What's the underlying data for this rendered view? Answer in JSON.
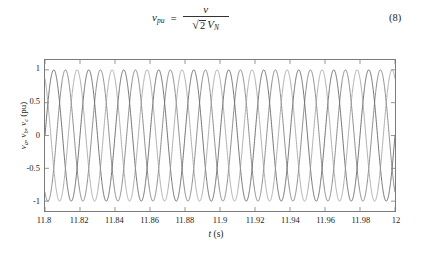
{
  "equation": {
    "lhs_var": "v",
    "lhs_sub": "pu",
    "equals": "=",
    "numerator": "v",
    "radical_glyph": "√",
    "radicand": "2",
    "denominator_var": "V",
    "denominator_sub": "N",
    "number": "(8)"
  },
  "chart_data": {
    "type": "line",
    "title": "",
    "xlabel_main": "t",
    "xlabel_unit": "(s)",
    "ylabel_parts": [
      "v",
      "a",
      ", ",
      "v",
      "b",
      ", ",
      "v",
      "c",
      " (pu)"
    ],
    "ylabel_plain": "v_a, v_b, v_c (pu)",
    "xlim": [
      11.8,
      12.0
    ],
    "ylim": [
      -1.15,
      1.15
    ],
    "xticks": [
      11.8,
      11.82,
      11.84,
      11.86,
      11.88,
      11.9,
      11.92,
      11.94,
      11.96,
      11.98,
      12
    ],
    "xticklabels": [
      "11.8",
      "11.82",
      "11.84",
      "11.86",
      "11.88",
      "11.9",
      "11.92",
      "11.94",
      "11.96",
      "11.98",
      "12"
    ],
    "yticks": [
      1,
      0.5,
      0,
      -0.5,
      -1
    ],
    "yticklabels": [
      "1",
      "0.5",
      "0",
      "-0.5",
      "-1"
    ],
    "grid": false,
    "legend": "none",
    "frequency_hz": 50,
    "amplitude_pu": 1.0,
    "series": [
      {
        "name": "v_a",
        "phase_deg": 0,
        "color": "#4d4d4d",
        "linewidth": 0.8
      },
      {
        "name": "v_b",
        "phase_deg": -120,
        "color": "#6e6e6e",
        "linewidth": 0.8
      },
      {
        "name": "v_c",
        "phase_deg": 120,
        "color": "#9a9a9a",
        "linewidth": 0.8
      }
    ]
  },
  "axis_color": "#7b7b7b"
}
